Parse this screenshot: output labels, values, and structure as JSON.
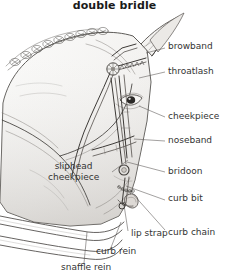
{
  "figure": {
    "title": "double bridle",
    "style": "pencil-line-drawing",
    "ink_color": "#3d3a37",
    "label_color": "#333333",
    "background": "#ffffff"
  },
  "labels": [
    {
      "id": "browband",
      "text": "browband",
      "side": "right",
      "x": 168,
      "y": 41,
      "line": [
        [
          165,
          48
        ],
        [
          146,
          53
        ]
      ]
    },
    {
      "id": "throatlash",
      "text": "throatlash",
      "side": "right",
      "x": 168,
      "y": 66,
      "line": [
        [
          165,
          72
        ],
        [
          139,
          78
        ]
      ]
    },
    {
      "id": "cheekpiece-right",
      "text": "cheekpiece",
      "side": "right",
      "x": 168,
      "y": 111,
      "line": [
        [
          165,
          117
        ],
        [
          139,
          106
        ]
      ]
    },
    {
      "id": "noseband",
      "text": "noseband",
      "side": "right",
      "x": 168,
      "y": 135,
      "line": [
        [
          165,
          141
        ],
        [
          134,
          139
        ]
      ]
    },
    {
      "id": "bridoon",
      "text": "bridoon",
      "side": "right",
      "x": 168,
      "y": 166,
      "line": [
        [
          165,
          172
        ],
        [
          127,
          162
        ]
      ]
    },
    {
      "id": "curb-bit",
      "text": "curb bit",
      "side": "right",
      "x": 168,
      "y": 198,
      "line": [
        [
          165,
          200
        ],
        [
          126,
          186
        ]
      ]
    },
    {
      "id": "curb-chain",
      "text": "curb chain",
      "side": "right",
      "x": 168,
      "y": 232,
      "line": [
        [
          165,
          230
        ],
        [
          132,
          193
        ]
      ]
    },
    {
      "id": "sliphead-cheekpiece",
      "text": "sliphead",
      "text2": "cheekpiece",
      "side": "left",
      "x": 48,
      "y": 161,
      "line": [
        [
          112,
          172
        ],
        [
          128,
          160
        ]
      ]
    },
    {
      "id": "lip-strap",
      "text": "lip strap",
      "side": "center",
      "x": 120,
      "y": 233,
      "line": [
        [
          128,
          231
        ],
        [
          124,
          205
        ]
      ]
    },
    {
      "id": "curb-rein",
      "text": "curb rein",
      "side": "center",
      "x": 96,
      "y": 252,
      "line": [
        [
          110,
          250
        ],
        [
          121,
          222
        ]
      ]
    },
    {
      "id": "snaffle-rein",
      "text": "snaffle rein",
      "side": "center",
      "x": 61,
      "y": 265,
      "line": [
        [
          84,
          263
        ],
        [
          87,
          232
        ]
      ]
    }
  ]
}
